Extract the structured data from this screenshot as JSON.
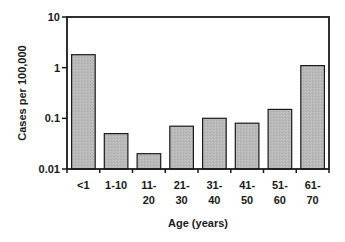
{
  "chart_data": {
    "type": "bar",
    "title": "",
    "xlabel": "Age (years)",
    "ylabel": "Cases per 100,000",
    "yscale": "log",
    "ylim": [
      0.01,
      10
    ],
    "yticks": [
      0.01,
      0.1,
      1,
      10
    ],
    "ytick_labels": [
      "0.01",
      "0.1",
      "1",
      "10"
    ],
    "grid": false,
    "legend": null,
    "categories": [
      "<1",
      "1-10",
      "11-20",
      "21-30",
      "31-40",
      "41-50",
      "51-60",
      "61-70"
    ],
    "category_label_lines": [
      [
        "<1"
      ],
      [
        "1-10"
      ],
      [
        "11-",
        "20"
      ],
      [
        "21-",
        "30"
      ],
      [
        "31-",
        "40"
      ],
      [
        "41-",
        "50"
      ],
      [
        "51-",
        "60"
      ],
      [
        "61-",
        "70"
      ]
    ],
    "values": [
      1.8,
      0.05,
      0.02,
      0.07,
      0.1,
      0.08,
      0.15,
      1.1
    ],
    "colors": {
      "bar_fill": "#b8b8b8",
      "bar_stroke": "#1a1a1a",
      "axis": "#1a1a1a"
    }
  }
}
